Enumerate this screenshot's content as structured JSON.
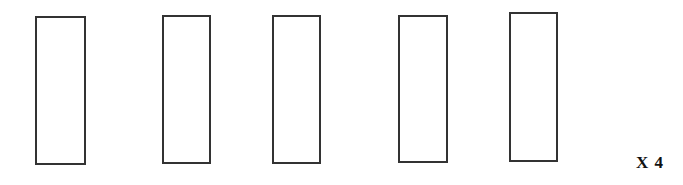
{
  "diagram": {
    "rectangles": [
      {
        "id": 1,
        "x": 35,
        "y": 16,
        "w": 51,
        "h": 149
      },
      {
        "id": 2,
        "x": 162,
        "y": 15,
        "w": 49,
        "h": 149
      },
      {
        "id": 3,
        "x": 272,
        "y": 15,
        "w": 49,
        "h": 149
      },
      {
        "id": 4,
        "x": 398,
        "y": 15,
        "w": 50,
        "h": 148
      },
      {
        "id": 5,
        "x": 509,
        "y": 12,
        "w": 49,
        "h": 150
      }
    ],
    "multiplier_label": "X 4",
    "stroke_color": "#333333",
    "background_color": "#ffffff"
  }
}
